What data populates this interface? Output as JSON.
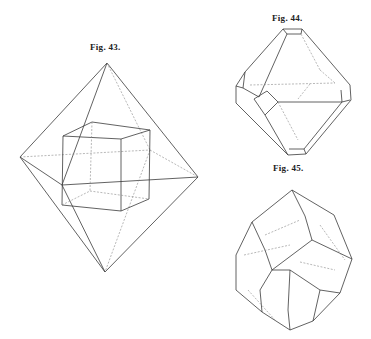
{
  "figures": [
    {
      "label": "Fig. 43.",
      "subject": "octahedron with inscribed cube"
    },
    {
      "label": "Fig. 44.",
      "subject": "octahedron truncated by cube faces"
    },
    {
      "label": "Fig. 45.",
      "subject": "complex crystal combination form"
    }
  ],
  "colors": {
    "line": "#3a3a3a",
    "hidden_line": "#888888",
    "background": "#ffffff"
  }
}
